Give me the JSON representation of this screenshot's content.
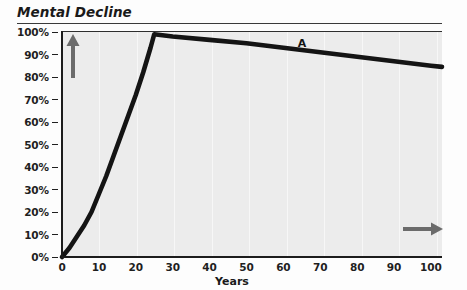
{
  "chart_data": {
    "type": "line",
    "title": "Mental Decline",
    "xlabel": "Years",
    "ylabel": "",
    "xlim": [
      0,
      103
    ],
    "ylim": [
      0,
      100
    ],
    "grid": true,
    "legend_position": "inline-annotation",
    "x_ticks": [
      0,
      10,
      20,
      30,
      40,
      50,
      60,
      70,
      80,
      90,
      100
    ],
    "x_tick_labels": [
      "0",
      "10",
      "20",
      "30",
      "40",
      "50",
      "60",
      "70",
      "80",
      "90",
      "100"
    ],
    "y_ticks": [
      0,
      10,
      20,
      30,
      40,
      50,
      60,
      70,
      80,
      90,
      100
    ],
    "y_tick_labels": [
      "0%",
      "10%",
      "20%",
      "30%",
      "40%",
      "50%",
      "60%",
      "70%",
      "80%",
      "90%",
      "100%"
    ],
    "annotations": [
      {
        "text": "A",
        "x": 65,
        "y": 95
      }
    ],
    "series": [
      {
        "name": "A",
        "color": "#141414",
        "x": [
          0,
          2,
          4,
          6,
          8,
          10,
          12,
          14,
          16,
          18,
          20,
          22,
          24,
          25,
          30,
          40,
          50,
          60,
          70,
          80,
          90,
          100,
          103
        ],
        "y": [
          0,
          4,
          9,
          14,
          20,
          28,
          36,
          45,
          54,
          63,
          72,
          82,
          93,
          99,
          98,
          96.5,
          95,
          93,
          91,
          89,
          87,
          85,
          84.5
        ]
      }
    ]
  },
  "axis_arrows": {
    "vertical": "up-arrow",
    "horizontal": "right-arrow",
    "color": "#6b6b6b"
  },
  "colors": {
    "plot_background": "#ececec",
    "page_background": "#fdfdfd",
    "axis": "#1c1c1c",
    "gridline": "#f7f7f7",
    "text": "#1f1f1f",
    "series_a": "#141414"
  }
}
